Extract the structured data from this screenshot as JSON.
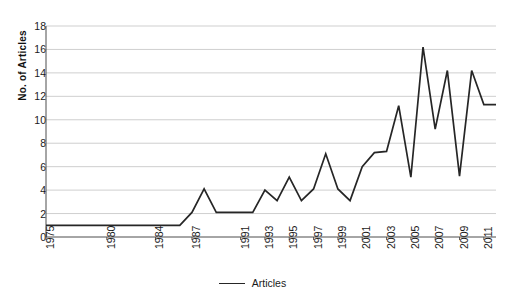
{
  "chart_data": {
    "type": "line",
    "title": "",
    "xlabel": "",
    "ylabel": "No. of Articles",
    "ylim": [
      0,
      18
    ],
    "xlim": [
      1975,
      2012
    ],
    "yticks": [
      0,
      2,
      4,
      6,
      8,
      10,
      12,
      14,
      16,
      18
    ],
    "xticks": [
      1975,
      1980,
      1984,
      1987,
      1991,
      1993,
      1995,
      1997,
      1999,
      2001,
      2003,
      2005,
      2007,
      2009,
      2011
    ],
    "grid": "horizontal",
    "legend_position": "bottom-center",
    "series": [
      {
        "name": "Articles",
        "color": "#262626",
        "x": [
          1975,
          1980,
          1984,
          1986,
          1987,
          1988,
          1989,
          1990,
          1991,
          1992,
          1993,
          1994,
          1995,
          1996,
          1997,
          1998,
          1999,
          2000,
          2001,
          2002,
          2003,
          2004,
          2005,
          2006,
          2007,
          2008,
          2009,
          2010,
          2011,
          2012
        ],
        "values": [
          1,
          1,
          1,
          1,
          2.1,
          4.1,
          2.1,
          2.1,
          2.1,
          2.1,
          4.0,
          3.1,
          5.1,
          3.1,
          4.1,
          7.1,
          4.1,
          3.1,
          6.0,
          7.2,
          7.3,
          11.2,
          5.1,
          16.2,
          9.2,
          14.2,
          5.2,
          14.2,
          11.3,
          11.3
        ]
      }
    ],
    "points": [
      {
        "year": 1975,
        "value": 1
      },
      {
        "year": 1976,
        "value": 1
      },
      {
        "year": 1977,
        "value": 1
      },
      {
        "year": 1978,
        "value": 1
      },
      {
        "year": 1979,
        "value": 1
      },
      {
        "year": 1980,
        "value": 1
      },
      {
        "year": 1981,
        "value": 1
      },
      {
        "year": 1982,
        "value": 1
      },
      {
        "year": 1983,
        "value": 1
      },
      {
        "year": 1984,
        "value": 1
      },
      {
        "year": 1985,
        "value": 1
      },
      {
        "year": 1986,
        "value": 1
      },
      {
        "year": 1987,
        "value": 1
      },
      {
        "year": 1988,
        "value": 4
      },
      {
        "year": 1989,
        "value": 2
      },
      {
        "year": 1990,
        "value": 2
      },
      {
        "year": 1991,
        "value": 2
      },
      {
        "year": 1992,
        "value": 2
      },
      {
        "year": 1993,
        "value": 2
      },
      {
        "year": 1994,
        "value": 4
      },
      {
        "year": 1995,
        "value": 3
      },
      {
        "year": 1996,
        "value": 5
      },
      {
        "year": 1997,
        "value": 3
      },
      {
        "year": 1998,
        "value": 4
      },
      {
        "year": 1999,
        "value": 7
      },
      {
        "year": 2000,
        "value": 4
      },
      {
        "year": 2001,
        "value": 3
      },
      {
        "year": 2002,
        "value": 6
      },
      {
        "year": 2003,
        "value": 7
      },
      {
        "year": 2004,
        "value": 7
      },
      {
        "year": 2005,
        "value": 11
      },
      {
        "year": 2006,
        "value": 5
      },
      {
        "year": 2007,
        "value": 16
      },
      {
        "year": 2008,
        "value": 9
      },
      {
        "year": 2009,
        "value": 14
      },
      {
        "year": 2010,
        "value": 5
      },
      {
        "year": 2011,
        "value": 14
      },
      {
        "year": 2012,
        "value": 11
      }
    ]
  },
  "axis": {
    "y_title": "No. of Articles",
    "y_tick_labels": [
      "0",
      "2",
      "4",
      "6",
      "8",
      "10",
      "12",
      "14",
      "16",
      "18"
    ],
    "x_tick_labels": [
      "1975",
      "1980",
      "1984",
      "1987",
      "1991",
      "1993",
      "1995",
      "1997",
      "1999",
      "2001",
      "2003",
      "2005",
      "2007",
      "2009",
      "2011"
    ]
  },
  "legend": {
    "entries": [
      {
        "label": "Articles",
        "color": "#262626"
      }
    ]
  },
  "colors": {
    "line": "#262626",
    "gridline": "#c9c9c9",
    "axis": "#4d4d4d",
    "text": "#1a1a1a",
    "background": "#ffffff"
  }
}
